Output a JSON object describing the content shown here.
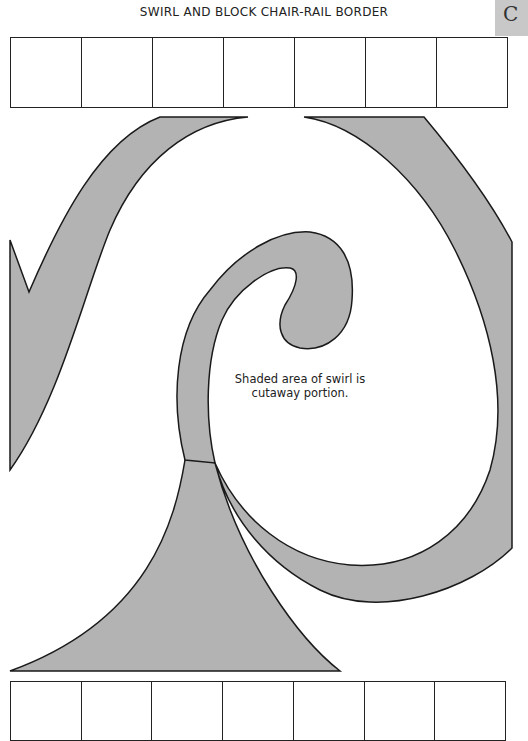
{
  "header": {
    "title": "SWIRL AND BLOCK CHAIR-RAIL BORDER",
    "corner_tab_letter": "C"
  },
  "top_blocks": {
    "count": 7
  },
  "bottom_blocks": {
    "count": 7
  },
  "caption": {
    "line1": "Shaded area of swirl is",
    "line2": "cutaway portion."
  },
  "colors": {
    "shade": "#b3b3b3",
    "outline": "#1a1a1a",
    "tab": "#c8c8c8"
  }
}
